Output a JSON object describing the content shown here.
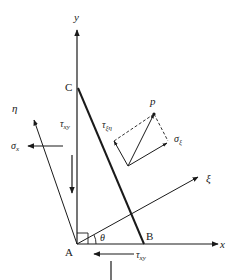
{
  "diagram": {
    "colors": {
      "stroke": "#1a1a1a",
      "background": "#ffffff"
    },
    "axes": {
      "x": "x",
      "y": "y",
      "xi": "ξ",
      "eta": "η"
    },
    "points": {
      "A": "A",
      "B": "B",
      "C": "C",
      "p": "p"
    },
    "angle": "θ",
    "stresses": {
      "sigma_x": {
        "base": "σ",
        "sub": "x"
      },
      "sigma_y": {
        "base": "σ",
        "sub": "y"
      },
      "tau_xy_left": {
        "base": "τ",
        "sub": "xy"
      },
      "tau_xy_bottom": {
        "base": "τ",
        "sub": "xy"
      },
      "sigma_xi": {
        "base": "σ",
        "sub": "ξ"
      },
      "tau_xi_eta": {
        "base": "τ",
        "sub": "ξη"
      }
    }
  }
}
